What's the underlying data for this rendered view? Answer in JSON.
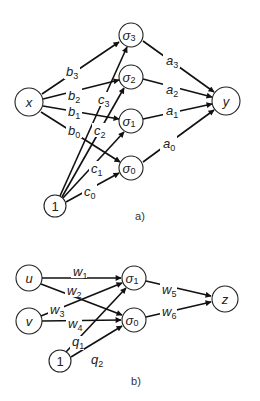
{
  "diagram_a": {
    "caption": "a)",
    "nodes": [
      {
        "id": "x",
        "label": "x",
        "sub": "",
        "cx": 29,
        "cy": 102,
        "r": 14
      },
      {
        "id": "one_a",
        "label": "1",
        "sub": "",
        "cx": 55,
        "cy": 206,
        "r": 11
      },
      {
        "id": "s3",
        "label": "σ",
        "sub": "3",
        "cx": 131,
        "cy": 35,
        "r": 12
      },
      {
        "id": "s2",
        "label": "σ",
        "sub": "2",
        "cx": 131,
        "cy": 77,
        "r": 12
      },
      {
        "id": "s1",
        "label": "σ",
        "sub": "1",
        "cx": 131,
        "cy": 121,
        "r": 12
      },
      {
        "id": "s0",
        "label": "σ",
        "sub": "0",
        "cx": 131,
        "cy": 168,
        "r": 12
      },
      {
        "id": "y",
        "label": "y",
        "sub": "",
        "cx": 226,
        "cy": 101,
        "r": 14
      }
    ],
    "edge_labels": [
      {
        "text": "b",
        "sub": "3",
        "x": 66,
        "y": 76
      },
      {
        "text": "b",
        "sub": "2",
        "x": 68,
        "y": 100
      },
      {
        "text": "b",
        "sub": "1",
        "x": 68,
        "y": 116
      },
      {
        "text": "b",
        "sub": "0",
        "x": 68,
        "y": 135
      },
      {
        "text": "c",
        "sub": "3",
        "x": 98,
        "y": 104
      },
      {
        "text": "c",
        "sub": "2",
        "x": 94,
        "y": 135
      },
      {
        "text": "c",
        "sub": "1",
        "x": 91,
        "y": 173
      },
      {
        "text": "c",
        "sub": "0",
        "x": 84,
        "y": 196
      },
      {
        "text": "a",
        "sub": "3",
        "x": 166,
        "y": 65
      },
      {
        "text": "a",
        "sub": "2",
        "x": 166,
        "y": 94
      },
      {
        "text": "a",
        "sub": "1",
        "x": 166,
        "y": 115
      },
      {
        "text": "a",
        "sub": "0",
        "x": 163,
        "y": 148
      }
    ]
  },
  "diagram_b": {
    "caption": "b)",
    "nodes": [
      {
        "id": "u",
        "label": "u",
        "sub": "",
        "cx": 29,
        "cy": 278,
        "r": 13
      },
      {
        "id": "v",
        "label": "v",
        "sub": "",
        "cx": 29,
        "cy": 321,
        "r": 13
      },
      {
        "id": "one_b",
        "label": "1",
        "sub": "",
        "cx": 60,
        "cy": 361,
        "r": 11
      },
      {
        "id": "bs1",
        "label": "σ",
        "sub": "1",
        "cx": 134,
        "cy": 278,
        "r": 12
      },
      {
        "id": "bs0",
        "label": "σ",
        "sub": "0",
        "cx": 134,
        "cy": 320,
        "r": 12
      },
      {
        "id": "z",
        "label": "z",
        "sub": "",
        "cx": 225,
        "cy": 299,
        "r": 13
      }
    ],
    "edge_labels": [
      {
        "text": "w",
        "sub": "1",
        "x": 73,
        "y": 276
      },
      {
        "text": "w",
        "sub": "2",
        "x": 67,
        "y": 295
      },
      {
        "text": "w",
        "sub": "3",
        "x": 50,
        "y": 314
      },
      {
        "text": "w",
        "sub": "4",
        "x": 68,
        "y": 328
      },
      {
        "text": "q",
        "sub": "1",
        "x": 72,
        "y": 346
      },
      {
        "text": "q",
        "sub": "2",
        "x": 91,
        "y": 362
      },
      {
        "text": "w",
        "sub": "5",
        "x": 162,
        "y": 294
      },
      {
        "text": "w",
        "sub": "6",
        "x": 162,
        "y": 316
      }
    ]
  }
}
